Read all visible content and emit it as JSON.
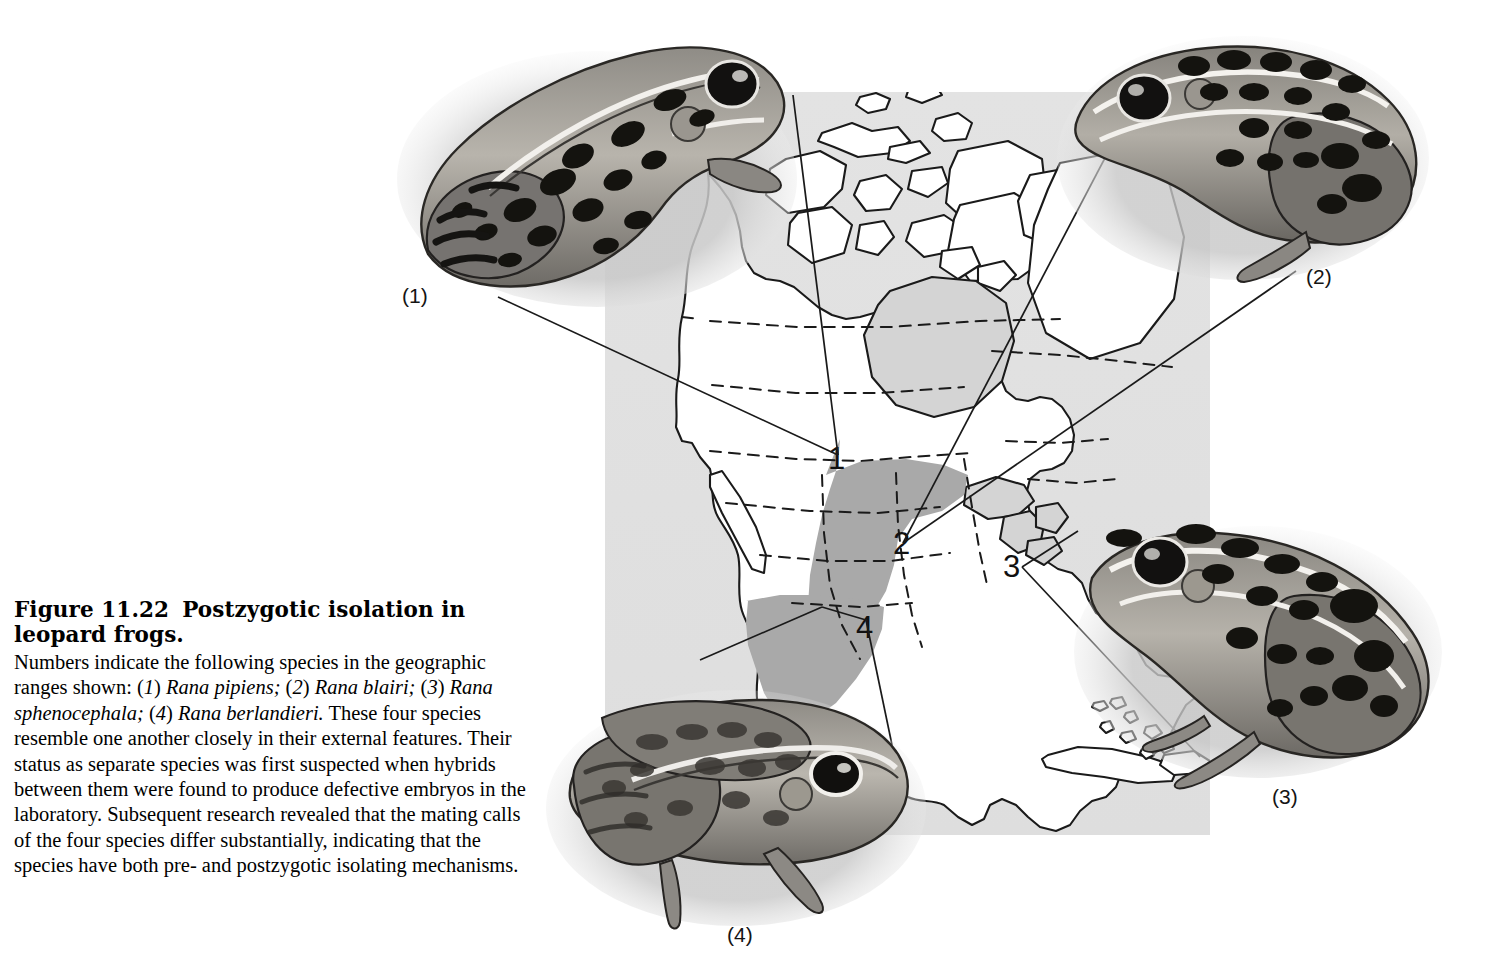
{
  "figure": {
    "number_label": "Figure 11.22",
    "title": "Postzygotic isolation in leopard frogs.",
    "caption_segments": {
      "s1": "Numbers indicate the following species in the geographic ranges shown: (",
      "n1": "1",
      "s2": ") ",
      "sp1": "Rana pipiens;",
      "s3": " (",
      "n2": "2",
      "s4": ") ",
      "sp2": "Rana blairi;",
      "s5": " (",
      "n3": "3",
      "s6": ") ",
      "sp3": "Rana sphenocephala;",
      "s7": " (",
      "n4": "4",
      "s8": ") ",
      "sp4": "Rana berlandieri.",
      "s9": " These four species resemble one another closely in their external features. Their status as separate species was first suspected when hybrids between them were found to produce defective embryos in the laboratory. Subsequent research revealed that the mating calls of the four species differ substantially, indicating that the species have both pre- and postzygotic isolating mechanisms."
    }
  },
  "map": {
    "region_name": "North America",
    "background_color": "#e0e0e0",
    "land_fill": "#ffffff",
    "range_shade_color": "#a9a9a9",
    "outline_color": "#1a1a1a",
    "markers": [
      {
        "id": "1",
        "label": "1",
        "species": "Rana pipiens"
      },
      {
        "id": "2",
        "label": "2",
        "species": "Rana blairi"
      },
      {
        "id": "3",
        "label": "3",
        "species": "Rana sphenocephala"
      },
      {
        "id": "4",
        "label": "4",
        "species": "Rana berlandieri"
      }
    ]
  },
  "photos": [
    {
      "id": "1",
      "label": "(1)",
      "species": "Rana pipiens",
      "icon": "leopard-frog-photo",
      "facing": "right"
    },
    {
      "id": "2",
      "label": "(2)",
      "species": "Rana blairi",
      "icon": "leopard-frog-photo",
      "facing": "left"
    },
    {
      "id": "3",
      "label": "(3)",
      "species": "Rana sphenocephala",
      "icon": "leopard-frog-photo",
      "facing": "left"
    },
    {
      "id": "4",
      "label": "(4)",
      "species": "Rana berlandieri",
      "icon": "leopard-frog-photo",
      "facing": "right"
    }
  ]
}
